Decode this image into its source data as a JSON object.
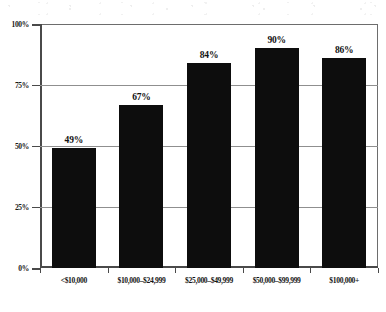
{
  "chart_data": {
    "type": "bar",
    "title": "",
    "subtitle": "",
    "xlabel": "",
    "ylabel": "",
    "ylim": [
      0,
      100
    ],
    "grid": true,
    "legend": "none",
    "orientation": "vertical",
    "bar_color": "#0d0d0d",
    "grid_color": "#8f8f8f",
    "axis_color": "#4a4a4a",
    "value_label_suffix": "%",
    "categories": [
      "<$10,000",
      "$10,000–$24,999",
      "$25,000–$49,999",
      "$50,000–$99,999",
      "$100,000+"
    ],
    "values": [
      49,
      67,
      84,
      90,
      86
    ],
    "value_labels": [
      "49%",
      "67%",
      "84%",
      "90%",
      "86%"
    ],
    "yticks": [
      0,
      25,
      50,
      75,
      100
    ],
    "ytick_labels": [
      "0%",
      "25%",
      "50%",
      "75%",
      "100%"
    ]
  }
}
